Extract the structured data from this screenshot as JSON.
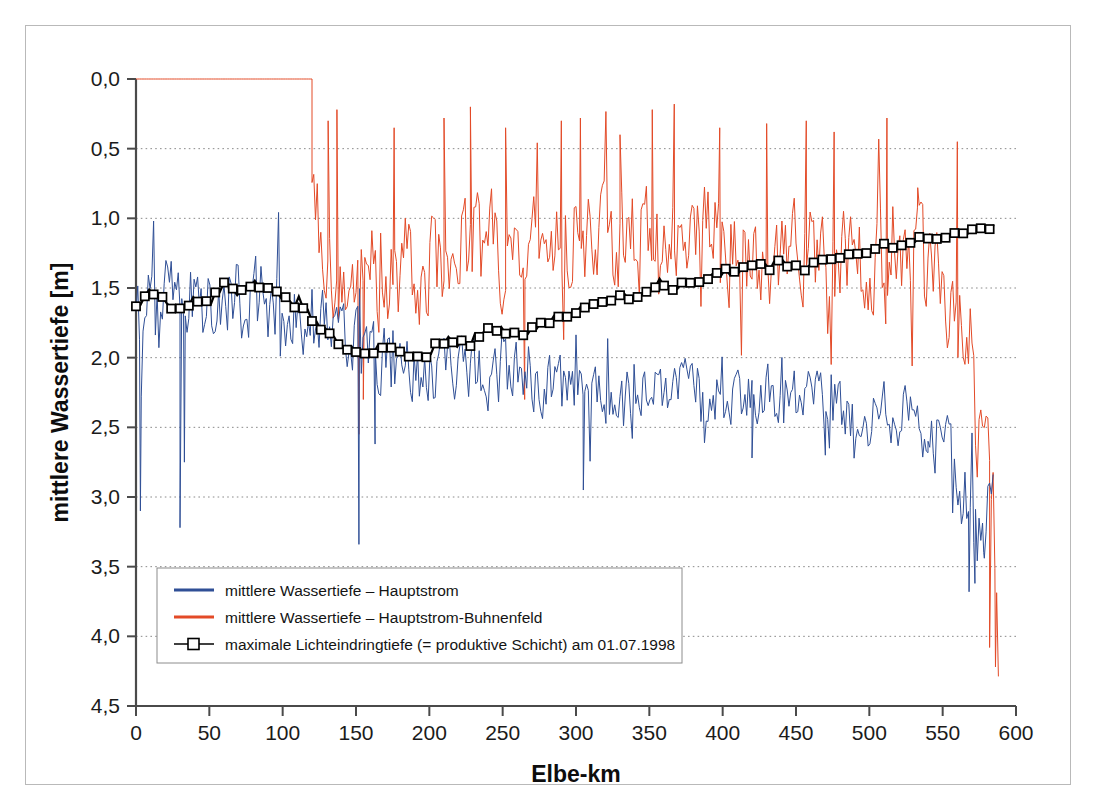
{
  "figure": {
    "border_color": "#b9b9b9",
    "background": "#ffffff"
  },
  "chart_data": {
    "type": "line",
    "title": "",
    "xlabel": "Elbe-km",
    "ylabel": "mittlere Wassertiefe [m]",
    "xlim": [
      0,
      600
    ],
    "ylim": [
      0.0,
      4.5
    ],
    "y_inverted": true,
    "grid": true,
    "xticks": [
      0,
      50,
      100,
      150,
      200,
      250,
      300,
      350,
      400,
      450,
      500,
      550,
      600
    ],
    "xticklabels": [
      "0",
      "50",
      "100",
      "150",
      "200",
      "250",
      "300",
      "350",
      "400",
      "450",
      "500",
      "550",
      "600"
    ],
    "yticks": [
      0.0,
      0.5,
      1.0,
      1.5,
      2.0,
      2.5,
      3.0,
      3.5,
      4.0,
      4.5
    ],
    "yticklabels": [
      "0,0",
      "0,5",
      "1,0",
      "1,5",
      "2,0",
      "2,5",
      "3,0",
      "3,5",
      "4,0",
      "4,5"
    ],
    "legend_position": "lower left",
    "colors": {
      "hauptstrom": "#2f4f96",
      "buhnenfeld": "#e34a27",
      "lichteindringtiefe": "#000000",
      "marker_face": "#ffffff",
      "grid": "#8a8a8a",
      "axis": "#4a4a4a"
    },
    "series": [
      {
        "name": "mittlere Wassertiefe – Hauptstrom",
        "key": "hauptstrom",
        "color": "#2f4f96",
        "style": "line",
        "linewidth": 1.0,
        "x_start": 0,
        "x_end": 585,
        "x_step": 1.2,
        "seed": 7341,
        "description": "noisy mean water depth of the main channel, baseline drifting from ~1.7 m at km 0 to ~2.2 m near km 500 then deepening to ~3.6 m at km 575",
        "baseline_nodes": [
          [
            0,
            1.7
          ],
          [
            20,
            1.62
          ],
          [
            40,
            1.62
          ],
          [
            60,
            1.6
          ],
          [
            80,
            1.58
          ],
          [
            100,
            1.62
          ],
          [
            120,
            1.72
          ],
          [
            140,
            1.85
          ],
          [
            160,
            2.02
          ],
          [
            180,
            2.08
          ],
          [
            200,
            2.1
          ],
          [
            220,
            2.12
          ],
          [
            240,
            2.12
          ],
          [
            260,
            2.15
          ],
          [
            280,
            2.18
          ],
          [
            300,
            2.3
          ],
          [
            320,
            2.26
          ],
          [
            340,
            2.22
          ],
          [
            360,
            2.2
          ],
          [
            380,
            2.22
          ],
          [
            400,
            2.26
          ],
          [
            420,
            2.28
          ],
          [
            440,
            2.26
          ],
          [
            460,
            2.3
          ],
          [
            480,
            2.36
          ],
          [
            500,
            2.42
          ],
          [
            520,
            2.4
          ],
          [
            540,
            2.52
          ],
          [
            555,
            2.7
          ],
          [
            565,
            3.05
          ],
          [
            575,
            3.45
          ],
          [
            585,
            2.9
          ]
        ],
        "noise_amplitude": [
          [
            0,
            0.42
          ],
          [
            120,
            0.4
          ],
          [
            160,
            0.34
          ],
          [
            300,
            0.32
          ],
          [
            460,
            0.3
          ],
          [
            540,
            0.34
          ],
          [
            585,
            0.55
          ]
        ],
        "spikes": [
          [
            3,
            3.1
          ],
          [
            30,
            3.22
          ],
          [
            33,
            2.75
          ],
          [
            152,
            3.34
          ],
          [
            163,
            2.62
          ],
          [
            305,
            2.95
          ],
          [
            420,
            2.72
          ],
          [
            470,
            2.7
          ],
          [
            540,
            2.6
          ],
          [
            568,
            3.68
          ],
          [
            572,
            3.62
          ],
          [
            578,
            3.4
          ]
        ]
      },
      {
        "name": "mittlere Wassertiefe – Hauptstrom-Buhnenfeld",
        "key": "buhnenfeld",
        "color": "#e34a27",
        "style": "line",
        "linewidth": 1.0,
        "x_start": 0,
        "x_end": 588,
        "x_step": 1.2,
        "seed": 1187,
        "flat_until_km": 120,
        "flat_value": 0.0,
        "description": "groyne-field mean water depth; constant 0,0 m until km ~120, then highly variable between ~0,2 m and ~2,6 m",
        "baseline_nodes": [
          [
            120,
            1.05
          ],
          [
            140,
            1.35
          ],
          [
            160,
            1.45
          ],
          [
            180,
            1.4
          ],
          [
            200,
            1.32
          ],
          [
            220,
            1.2
          ],
          [
            240,
            1.15
          ],
          [
            260,
            1.25
          ],
          [
            280,
            1.22
          ],
          [
            300,
            1.18
          ],
          [
            320,
            1.15
          ],
          [
            340,
            1.05
          ],
          [
            360,
            1.05
          ],
          [
            380,
            1.12
          ],
          [
            400,
            1.2
          ],
          [
            420,
            1.25
          ],
          [
            440,
            1.28
          ],
          [
            460,
            1.3
          ],
          [
            480,
            1.35
          ],
          [
            500,
            1.32
          ],
          [
            520,
            1.3
          ],
          [
            540,
            1.38
          ],
          [
            555,
            1.55
          ],
          [
            570,
            2.1
          ],
          [
            580,
            2.9
          ],
          [
            588,
            3.7
          ]
        ],
        "noise_amplitude": [
          [
            120,
            0.55
          ],
          [
            200,
            0.55
          ],
          [
            300,
            0.55
          ],
          [
            400,
            0.52
          ],
          [
            500,
            0.5
          ],
          [
            560,
            0.55
          ],
          [
            588,
            0.85
          ]
        ],
        "spikes": [
          [
            131,
            0.3
          ],
          [
            137,
            0.22
          ],
          [
            152,
            2.55
          ],
          [
            155,
            2.3
          ],
          [
            176,
            0.35
          ],
          [
            210,
            0.28
          ],
          [
            228,
            0.2
          ],
          [
            252,
            0.35
          ],
          [
            265,
            2.3
          ],
          [
            290,
            0.3
          ],
          [
            303,
            0.28
          ],
          [
            330,
            0.4
          ],
          [
            352,
            0.22
          ],
          [
            367,
            0.18
          ],
          [
            398,
            0.35
          ],
          [
            430,
            0.32
          ],
          [
            457,
            0.3
          ],
          [
            476,
            0.38
          ],
          [
            512,
            0.28
          ],
          [
            533,
            0.78
          ],
          [
            560,
            0.45
          ],
          [
            582,
            4.08
          ],
          [
            586,
            4.22
          ]
        ]
      },
      {
        "name": "maximale Lichteindringtiefe (= produktive Schicht) am 01.07.1998",
        "key": "lichteindringtiefe",
        "color": "#000000",
        "style": "line-marker",
        "marker": "square",
        "marker_face": "#ffffff",
        "marker_edge": "#000000",
        "linewidth": 2.2,
        "x_start": 0,
        "x_end": 585,
        "x_step": 3.0,
        "seed": 4421,
        "description": "maximum light penetration depth (productive layer) on 01.07.1998; shallows steadily from ~1,65 m at km 0 to ~1,05 m at km 585",
        "baseline_nodes": [
          [
            0,
            1.66
          ],
          [
            10,
            1.52
          ],
          [
            20,
            1.58
          ],
          [
            30,
            1.6
          ],
          [
            40,
            1.55
          ],
          [
            50,
            1.58
          ],
          [
            60,
            1.5
          ],
          [
            70,
            1.55
          ],
          [
            80,
            1.48
          ],
          [
            90,
            1.52
          ],
          [
            100,
            1.58
          ],
          [
            110,
            1.62
          ],
          [
            120,
            1.72
          ],
          [
            130,
            1.82
          ],
          [
            140,
            1.92
          ],
          [
            150,
            1.98
          ],
          [
            160,
            1.98
          ],
          [
            170,
            1.96
          ],
          [
            180,
            1.98
          ],
          [
            190,
            1.98
          ],
          [
            200,
            1.96
          ],
          [
            210,
            1.93
          ],
          [
            220,
            1.9
          ],
          [
            230,
            1.86
          ],
          [
            240,
            1.82
          ],
          [
            250,
            1.8
          ],
          [
            260,
            1.85
          ],
          [
            270,
            1.8
          ],
          [
            280,
            1.74
          ],
          [
            290,
            1.68
          ],
          [
            300,
            1.66
          ],
          [
            310,
            1.62
          ],
          [
            320,
            1.6
          ],
          [
            330,
            1.58
          ],
          [
            340,
            1.56
          ],
          [
            350,
            1.52
          ],
          [
            360,
            1.5
          ],
          [
            370,
            1.48
          ],
          [
            380,
            1.45
          ],
          [
            390,
            1.42
          ],
          [
            400,
            1.4
          ],
          [
            410,
            1.38
          ],
          [
            420,
            1.35
          ],
          [
            430,
            1.33
          ],
          [
            440,
            1.3
          ],
          [
            450,
            1.36
          ],
          [
            460,
            1.34
          ],
          [
            470,
            1.3
          ],
          [
            480,
            1.27
          ],
          [
            490,
            1.24
          ],
          [
            500,
            1.22
          ],
          [
            510,
            1.18
          ],
          [
            520,
            1.2
          ],
          [
            530,
            1.16
          ],
          [
            540,
            1.14
          ],
          [
            550,
            1.12
          ],
          [
            560,
            1.1
          ],
          [
            570,
            1.1
          ],
          [
            580,
            1.07
          ],
          [
            585,
            1.05
          ]
        ],
        "noise_amplitude": [
          [
            0,
            0.1
          ],
          [
            110,
            0.06
          ],
          [
            300,
            0.04
          ],
          [
            585,
            0.03
          ]
        ],
        "spikes": []
      }
    ]
  },
  "legend": {
    "entries": [
      {
        "label": "mittlere Wassertiefe – Hauptstrom",
        "swatch": "line",
        "color": "#2f4f96"
      },
      {
        "label": "mittlere Wassertiefe – Hauptstrom-Buhnenfeld",
        "swatch": "line",
        "color": "#e34a27"
      },
      {
        "label": "maximale Lichteindringtiefe (= produktive Schicht) am 01.07.1998",
        "swatch": "line-marker",
        "color": "#000000"
      }
    ]
  }
}
